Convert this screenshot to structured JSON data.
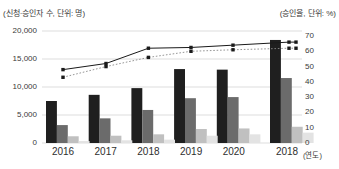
{
  "chart_data": {
    "type": "bar",
    "title": "",
    "left_axis_label": "(신청·승인자 수, 단위: 명)",
    "right_axis_label": "(승인율, 단위: %)",
    "x_axis_suffix": "(연도)",
    "categories": [
      "2016",
      "2017",
      "2018",
      "2019",
      "2020",
      "2018"
    ],
    "bar_series": [
      {
        "name": "series-1",
        "color": "#1f1f1f",
        "values": [
          7500,
          8600,
          9800,
          13200,
          13100,
          18400
        ]
      },
      {
        "name": "series-2",
        "color": "#6b6b6b",
        "values": [
          3200,
          4400,
          5900,
          8000,
          8200,
          11600
        ]
      },
      {
        "name": "series-3",
        "color": "#c0c0c0",
        "values": [
          1200,
          1300,
          1550,
          2500,
          2600,
          2900
        ]
      },
      {
        "name": "series-4",
        "color": "#e3e3e3",
        "values": [
          350,
          480,
          600,
          1300,
          1550,
          1850
        ]
      }
    ],
    "line_series": [
      {
        "name": "approval-rate-solid-line",
        "style": "solid",
        "color": "#1a1a1a",
        "axis": "right",
        "values": [
          48,
          52,
          62,
          62.5,
          64,
          66
        ]
      },
      {
        "name": "approval-rate-dotted-line",
        "style": "dotted",
        "color": "#8a8a8a",
        "axis": "right",
        "values": [
          43,
          50,
          56,
          60,
          61,
          62
        ]
      }
    ],
    "left_axis": {
      "min": 0,
      "max": 20000,
      "ticks": [
        {
          "label": "20,000",
          "value": 20000
        },
        {
          "label": "15,000",
          "value": 15000
        },
        {
          "label": "10,000",
          "value": 10000
        },
        {
          "label": "5,000",
          "value": 5000
        },
        {
          "label": "0",
          "value": 0
        }
      ]
    },
    "right_axis": {
      "min": 0,
      "max": 70,
      "ticks": [
        {
          "label": "70",
          "value": 70
        },
        {
          "label": "60",
          "value": 60
        },
        {
          "label": "50",
          "value": 50
        },
        {
          "label": "40",
          "value": 40
        },
        {
          "label": "30",
          "value": 30
        },
        {
          "label": "20",
          "value": 20
        },
        {
          "label": "10",
          "value": 10
        },
        {
          "label": "0",
          "value": 0
        }
      ]
    },
    "grid": "horizontal-light-gray",
    "legend": "none",
    "colors": {
      "background": "#ffffff",
      "gridline": "#dddddd",
      "text": "#3a3a3a"
    }
  }
}
